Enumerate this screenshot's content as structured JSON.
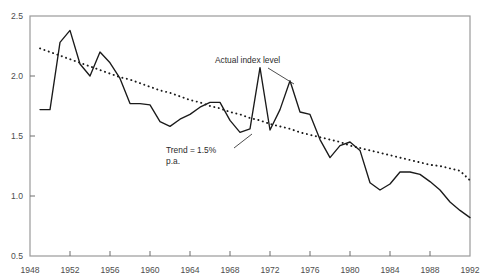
{
  "chart_data": {
    "type": "line",
    "title": "",
    "xlabel": "",
    "ylabel": "",
    "xlim": [
      1948,
      1992
    ],
    "ylim": [
      0.5,
      2.5
    ],
    "grid": false,
    "legend_position": "none",
    "x_ticks": [
      "1948",
      "1952",
      "1956",
      "1960",
      "1964",
      "1968",
      "1972",
      "1976",
      "1980",
      "1984",
      "1988",
      "1992"
    ],
    "y_ticks": [
      "0.5",
      "1.0",
      "1.5",
      "2.0",
      "2.5"
    ],
    "x": [
      1949,
      1950,
      1951,
      1952,
      1953,
      1954,
      1955,
      1956,
      1957,
      1958,
      1959,
      1960,
      1961,
      1962,
      1963,
      1964,
      1965,
      1966,
      1967,
      1968,
      1969,
      1970,
      1971,
      1972,
      1973,
      1974,
      1975,
      1976,
      1977,
      1978,
      1979,
      1980,
      1981,
      1982,
      1983,
      1984,
      1985,
      1986,
      1987,
      1988,
      1989,
      1990,
      1991,
      1992
    ],
    "series": [
      {
        "name": "Actual index level",
        "style": "solid",
        "color": "#1a1a1a",
        "values": [
          1.72,
          1.72,
          2.28,
          2.38,
          2.1,
          2.0,
          2.2,
          2.11,
          1.98,
          1.77,
          1.77,
          1.76,
          1.62,
          1.58,
          1.64,
          1.68,
          1.74,
          1.78,
          1.78,
          1.63,
          1.53,
          1.56,
          2.07,
          1.55,
          1.72,
          1.96,
          1.7,
          1.68,
          1.47,
          1.32,
          1.42,
          1.45,
          1.38,
          1.11,
          1.05,
          1.1,
          1.2,
          1.2,
          1.18,
          1.12,
          1.05,
          0.95,
          0.88,
          0.82
        ]
      },
      {
        "name": "Trend = 1.5% p.a.",
        "style": "dotted",
        "color": "#1a1a1a",
        "values": [
          2.23,
          2.2,
          2.17,
          2.14,
          2.11,
          2.08,
          2.05,
          2.02,
          1.99,
          1.97,
          1.94,
          1.91,
          1.88,
          1.86,
          1.83,
          1.8,
          1.78,
          1.75,
          1.73,
          1.7,
          1.68,
          1.65,
          1.63,
          1.6,
          1.58,
          1.56,
          1.53,
          1.51,
          1.49,
          1.47,
          1.45,
          1.42,
          1.4,
          1.38,
          1.36,
          1.34,
          1.32,
          1.3,
          1.28,
          1.26,
          1.25,
          1.23,
          1.21,
          1.13
        ]
      }
    ],
    "annotations": [
      {
        "name": "actual-index-level",
        "text": "Actual index level",
        "text_x": 215,
        "text_y": 63,
        "leader": [
          [
            268,
            68
          ],
          [
            294,
            84
          ]
        ]
      },
      {
        "name": "trend-rate",
        "line1": "Trend = 1.5%",
        "line2": "p.a.",
        "text_x": 166,
        "text_y": 153,
        "leader": [
          [
            234,
            148
          ],
          [
            252,
            134
          ]
        ]
      }
    ]
  }
}
